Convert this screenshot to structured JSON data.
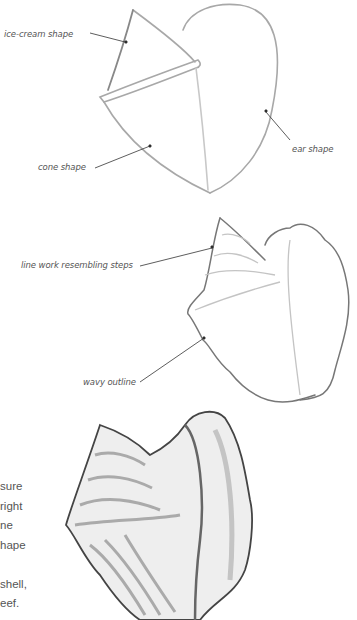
{
  "annotations": {
    "ice_cream": "ice-cream shape",
    "ear": "ear shape",
    "cone": "cone shape",
    "steps": "line work resembling steps",
    "wavy": "wavy outline"
  },
  "body_text": {
    "lines": [
      "sure",
      "right",
      "ne",
      "hape",
      "",
      "shell,",
      "eef."
    ]
  },
  "colors": {
    "text": "#555555",
    "sketch": "#9a9a9a",
    "ink": "#444444"
  }
}
